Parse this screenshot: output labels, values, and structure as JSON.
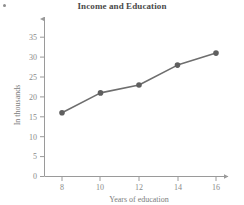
{
  "chart_data": {
    "type": "line",
    "title": "Income and Education",
    "xlabel": "Years of education",
    "ylabel": "In thousands",
    "x": [
      8,
      10,
      12,
      14,
      16
    ],
    "values": [
      16,
      21,
      23,
      28,
      31
    ],
    "series": [
      {
        "name": "Income",
        "values": [
          16,
          21,
          23,
          28,
          31
        ]
      }
    ],
    "xticks": [
      "8",
      "10",
      "12",
      "14",
      "16"
    ],
    "yticks": [
      "0",
      "5",
      "10",
      "15",
      "20",
      "25",
      "30",
      "35"
    ],
    "xlim": [
      7,
      17
    ],
    "ylim": [
      0,
      37
    ],
    "grid": false,
    "legend": false,
    "marker": "circle",
    "line_color": "#6e6e6e",
    "marker_color": "#5f5f5f",
    "axis_color": "#9a9a9a",
    "title_color": "#4a4a4a",
    "tick_label_color": "#8a8a8a",
    "axis_title_color": "#7d7d7d",
    "background_color": "#ffffff"
  },
  "figure": {
    "title": "Income and Education",
    "x_axis_title": "Years of education",
    "y_axis_title": "In thousands",
    "x_tick_labels": [
      "8",
      "10",
      "12",
      "14",
      "16"
    ],
    "y_tick_labels": [
      "0",
      "5",
      "10",
      "15",
      "20",
      "25",
      "30",
      "35"
    ],
    "point_labels": [
      "16",
      "21",
      "23",
      "28",
      "31"
    ]
  }
}
